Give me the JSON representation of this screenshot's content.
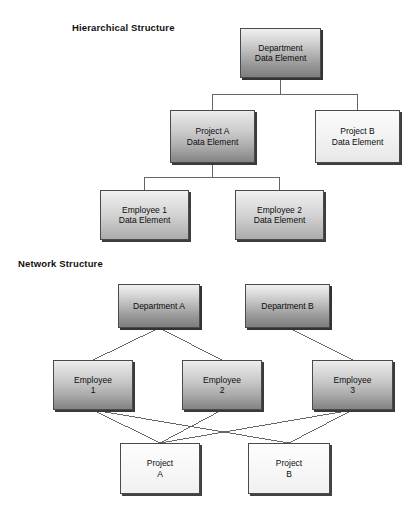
{
  "diagram": {
    "background_color": "#ffffff",
    "line_color": "#555555",
    "text_color": "#0d0d0d"
  },
  "sections": [
    {
      "id": "hierarchical",
      "title": "Hierarchical Structure",
      "title_x": 72,
      "title_y": 22,
      "nodes": [
        {
          "id": "h-department",
          "label": "Department\nData Element",
          "x": 240,
          "y": 28,
          "w": 81,
          "h": 50,
          "fill": "g-deep"
        },
        {
          "id": "h-project-a",
          "label": "Project A\nData Element",
          "x": 170,
          "y": 110,
          "w": 85,
          "h": 53,
          "fill": "g-dark"
        },
        {
          "id": "h-project-b",
          "label": "Project B\nData Element",
          "x": 315,
          "y": 110,
          "w": 85,
          "h": 53,
          "fill": "g-light"
        },
        {
          "id": "h-employee-1",
          "label": "Employee 1\nData Element",
          "x": 100,
          "y": 190,
          "w": 89,
          "h": 50,
          "fill": "g-mid"
        },
        {
          "id": "h-employee-2",
          "label": "Employee 2\nData Element",
          "x": 235,
          "y": 190,
          "w": 89,
          "h": 50,
          "fill": "g-mid"
        }
      ],
      "edges": [
        {
          "from": "h-department",
          "to": "h-project-a",
          "style": "orthogonal"
        },
        {
          "from": "h-department",
          "to": "h-project-b",
          "style": "orthogonal"
        },
        {
          "from": "h-project-a",
          "to": "h-employee-1",
          "style": "orthogonal"
        },
        {
          "from": "h-project-a",
          "to": "h-employee-2",
          "style": "orthogonal"
        }
      ]
    },
    {
      "id": "network",
      "title": "Network Structure",
      "title_x": 18,
      "title_y": 258,
      "nodes": [
        {
          "id": "n-department-a",
          "label": "Department A",
          "x": 118,
          "y": 284,
          "w": 82,
          "h": 44,
          "fill": "g-deep"
        },
        {
          "id": "n-department-b",
          "label": "Department B",
          "x": 245,
          "y": 284,
          "w": 85,
          "h": 44,
          "fill": "g-deep"
        },
        {
          "id": "n-employee-1",
          "label": "Employee\n1",
          "x": 53,
          "y": 360,
          "w": 80,
          "h": 50,
          "fill": "g-dark"
        },
        {
          "id": "n-employee-2",
          "label": "Employee\n2",
          "x": 182,
          "y": 360,
          "w": 80,
          "h": 50,
          "fill": "g-dark"
        },
        {
          "id": "n-employee-3",
          "label": "Employee\n3",
          "x": 312,
          "y": 360,
          "w": 81,
          "h": 50,
          "fill": "g-dark"
        },
        {
          "id": "n-project-a",
          "label": "Project\nA",
          "x": 120,
          "y": 443,
          "w": 80,
          "h": 51,
          "fill": "g-flat"
        },
        {
          "id": "n-project-b",
          "label": "Project\nB",
          "x": 248,
          "y": 443,
          "w": 82,
          "h": 51,
          "fill": "g-flat"
        }
      ],
      "edges": [
        {
          "from": "n-department-a",
          "to": "n-employee-1",
          "style": "diagonal"
        },
        {
          "from": "n-department-a",
          "to": "n-employee-2",
          "style": "diagonal"
        },
        {
          "from": "n-department-b",
          "to": "n-employee-3",
          "style": "diagonal"
        },
        {
          "from": "n-employee-1",
          "to": "n-project-a",
          "style": "diagonal"
        },
        {
          "from": "n-employee-1",
          "to": "n-project-b",
          "style": "diagonal"
        },
        {
          "from": "n-employee-2",
          "to": "n-project-a",
          "style": "diagonal"
        },
        {
          "from": "n-employee-3",
          "to": "n-project-a",
          "style": "diagonal"
        },
        {
          "from": "n-employee-3",
          "to": "n-project-b",
          "style": "diagonal"
        }
      ]
    }
  ]
}
